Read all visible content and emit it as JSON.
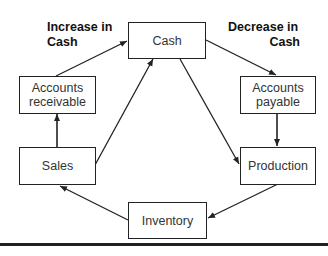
{
  "diagram": {
    "labels": {
      "increase": "Increase in\nCash",
      "increase_line1": "Increase in",
      "increase_line2": "Cash",
      "decrease_line1": "Decrease in",
      "decrease_line2": "Cash"
    },
    "nodes": {
      "cash": "Cash",
      "accounts_receivable_line1": "Accounts",
      "accounts_receivable_line2": "receivable",
      "accounts_payable_line1": "Accounts",
      "accounts_payable_line2": "payable",
      "sales": "Sales",
      "production": "Production",
      "inventory": "Inventory"
    },
    "edges": [
      {
        "from": "Accounts receivable",
        "to": "Cash"
      },
      {
        "from": "Cash",
        "to": "Accounts payable"
      },
      {
        "from": "Accounts payable",
        "to": "Production"
      },
      {
        "from": "Cash",
        "to": "Production"
      },
      {
        "from": "Sales",
        "to": "Cash"
      },
      {
        "from": "Sales",
        "to": "Accounts receivable"
      },
      {
        "from": "Production",
        "to": "Inventory"
      },
      {
        "from": "Inventory",
        "to": "Sales"
      }
    ],
    "colors": {
      "line": "#222222",
      "text": "#333333"
    }
  }
}
